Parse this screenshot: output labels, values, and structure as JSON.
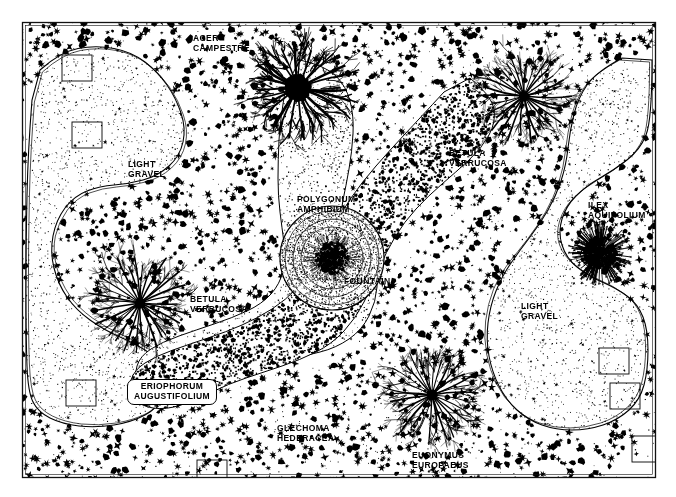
{
  "plan": {
    "title": "Garden Planting Plan",
    "frame": {
      "x": 22,
      "y": 22,
      "width": 633,
      "height": 455,
      "stroke_color": "#111111"
    },
    "background_color": "#ffffff",
    "ink_color": "#000000",
    "labels": [
      {
        "name": "label-acer-campestre",
        "text": "ACER\nCAMPESTRE",
        "x": 193,
        "y": 33,
        "boxed": false,
        "align": "left"
      },
      {
        "name": "label-light-gravel-left",
        "text": "LIGHT\nGRAVEL",
        "x": 128,
        "y": 159,
        "boxed": false,
        "align": "left"
      },
      {
        "name": "label-polygonum",
        "text": "POLYGONUM\nAMPHIBIUM",
        "x": 297,
        "y": 194,
        "boxed": false,
        "align": "left"
      },
      {
        "name": "label-fountain",
        "text": "FOUNTAIN",
        "x": 344,
        "y": 276,
        "boxed": false,
        "align": "left"
      },
      {
        "name": "label-betula-right",
        "text": "BETULA\nVERRUCOSA",
        "x": 449,
        "y": 148,
        "boxed": false,
        "align": "left"
      },
      {
        "name": "label-ilex",
        "text": "ILEX\nAQUIFOLIUM",
        "x": 588,
        "y": 200,
        "boxed": false,
        "align": "left"
      },
      {
        "name": "label-betula-left",
        "text": "BETULA\nVERRUCOSA",
        "x": 190,
        "y": 294,
        "boxed": false,
        "align": "left"
      },
      {
        "name": "label-light-gravel-right",
        "text": "LIGHT\nGRAVEL",
        "x": 521,
        "y": 301,
        "boxed": false,
        "align": "left"
      },
      {
        "name": "label-eriophorum",
        "text": "ERIOPHORUM\nAUGUSTIFOLIUM",
        "x": 172,
        "y": 379,
        "boxed": true,
        "align": "center"
      },
      {
        "name": "label-glechoma",
        "text": "GLECHOMA\nHEDERACEA",
        "x": 277,
        "y": 423,
        "boxed": false,
        "align": "left"
      },
      {
        "name": "label-euonymus",
        "text": "EUONYMUS\nEUROPAEUS",
        "x": 412,
        "y": 450,
        "boxed": false,
        "align": "left"
      }
    ],
    "trees": [
      {
        "name": "tree-acer-campestre",
        "x": 298,
        "y": 88,
        "canopy_radius": 52,
        "style": "dark-dense"
      },
      {
        "name": "tree-betula-north",
        "x": 524,
        "y": 96,
        "canopy_radius": 46,
        "style": "fine-line"
      },
      {
        "name": "tree-betula-west",
        "x": 140,
        "y": 303,
        "canopy_radius": 50,
        "style": "fine-line"
      },
      {
        "name": "tree-euonymus-south",
        "x": 432,
        "y": 395,
        "canopy_radius": 48,
        "style": "fine-line"
      }
    ],
    "shrubs": [
      {
        "name": "shrub-ilex-aquifolium",
        "x": 600,
        "y": 253,
        "radius": 32,
        "style": "spiky-dense"
      }
    ],
    "feature": {
      "name": "fountain-basin",
      "x": 332,
      "y": 258,
      "outer_radius": 52,
      "inner_radius": 16
    },
    "beds": [
      {
        "name": "bed-polygonum-amphibium",
        "fill": "stipple-light",
        "description": "pale stippled lobed bed running from top centre down to the fountain and out to the lower left"
      },
      {
        "name": "bed-dark-planting",
        "fill": "dense-black-stipple",
        "description": "dark curving band from top right across the middle to the lower left arm"
      },
      {
        "name": "bed-light-gravel-left",
        "fill": "fine-dot-stipple",
        "description": "light gravel area occupying the upper left quadrant"
      },
      {
        "name": "bed-light-gravel-right",
        "fill": "fine-dot-stipple",
        "description": "light gravel area occupying the right side"
      },
      {
        "name": "bed-ground-cover",
        "fill": "black-star-texture",
        "description": "star/leaf textured ground cover filling the remaining plan area"
      }
    ],
    "markers": [
      {
        "name": "marker-plot-square",
        "x": 62,
        "y": 55
      },
      {
        "name": "marker-plot-square",
        "x": 72,
        "y": 122
      },
      {
        "name": "marker-plot-square",
        "x": 66,
        "y": 380
      },
      {
        "name": "marker-plot-square",
        "x": 599,
        "y": 348
      },
      {
        "name": "marker-plot-square",
        "x": 610,
        "y": 383
      },
      {
        "name": "marker-plot-square",
        "x": 197,
        "y": 460
      },
      {
        "name": "marker-plot-square",
        "x": 632,
        "y": 436
      }
    ]
  }
}
